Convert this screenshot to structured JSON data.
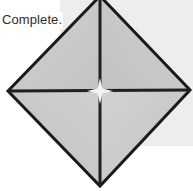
{
  "figure": {
    "caption": "Complete.",
    "shape_name": "origami-square-base-diagram",
    "colors": {
      "page_background": "#ffffff",
      "backdrop_panel": "#ededed",
      "diamond_fill": "#c9c9c9",
      "diamond_fill_light": "#d2d2d2",
      "outline": "#1a1a1a",
      "crease_line": "#1f1f1f",
      "center_highlight": "#f2f2f2",
      "caption_text": "#2b2b2b"
    },
    "geometry": {
      "diamond_vertices": [
        {
          "name": "top",
          "x": 100,
          "y": -4
        },
        {
          "name": "right",
          "x": 190,
          "y": 90
        },
        {
          "name": "bottom",
          "x": 100,
          "y": 186
        },
        {
          "name": "left",
          "x": 8,
          "y": 91
        }
      ],
      "center": {
        "x": 100,
        "y": 91
      },
      "crease_lines": [
        {
          "name": "vertical-crease",
          "x1": 100,
          "y1": -4,
          "x2": 100,
          "y2": 186
        },
        {
          "name": "horizontal-crease",
          "x1": 8,
          "y1": 91,
          "x2": 190,
          "y2": 90
        }
      ],
      "outline_width": 3,
      "crease_width": 3,
      "backdrop_panel": {
        "x": 60,
        "y": 0,
        "width": 133,
        "height": 146
      }
    }
  }
}
